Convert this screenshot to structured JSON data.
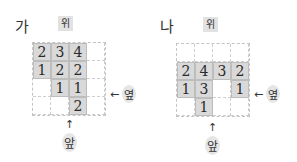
{
  "panels": [
    {
      "label": "가",
      "top_tag": "위",
      "side_label": "옆",
      "front_label": "앞",
      "arrow_side": "←",
      "arrow_front": "↑",
      "grid": [
        [
          "2",
          "3",
          "4",
          ""
        ],
        [
          "1",
          "2",
          "2",
          ""
        ],
        [
          "",
          "1",
          "1",
          ""
        ],
        [
          "",
          "",
          "2",
          ""
        ]
      ]
    },
    {
      "label": "나",
      "top_tag": "위",
      "side_label": "옆",
      "front_label": "앞",
      "arrow_side": "←",
      "arrow_front": "↑",
      "grid": [
        [
          "",
          "",
          "",
          ""
        ],
        [
          "2",
          "4",
          "3",
          "2"
        ],
        [
          "1",
          "3",
          "",
          "1"
        ],
        [
          "",
          "1",
          "",
          ""
        ]
      ]
    }
  ]
}
